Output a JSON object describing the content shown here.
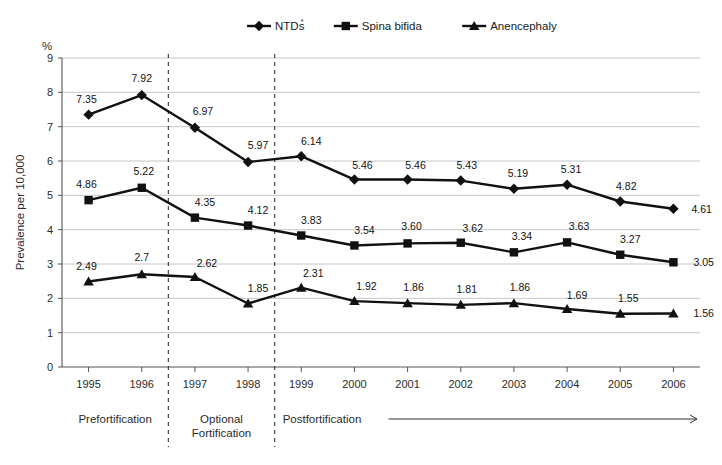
{
  "chart_data": {
    "type": "line",
    "title": "",
    "xlabel": "",
    "ylabel": "Prevalence per 10,000",
    "yunit": "%",
    "ylim": [
      0,
      9
    ],
    "ytick_labels": [
      "0",
      "1",
      "2",
      "3",
      "4",
      "5",
      "6",
      "7",
      "8",
      "9"
    ],
    "grid": true,
    "legend_position": "top",
    "categories": [
      "1995",
      "1996",
      "1997",
      "1998",
      "1999",
      "2000",
      "2001",
      "2002",
      "2003",
      "2004",
      "2005",
      "2006"
    ],
    "series": [
      {
        "name": "NTDs",
        "name_superscript": "*",
        "marker": "diamond",
        "values": [
          7.35,
          7.92,
          6.97,
          5.97,
          6.14,
          5.46,
          5.46,
          5.43,
          5.19,
          5.31,
          4.82,
          4.61
        ],
        "labels": [
          "7.35",
          "7.92",
          "6.97",
          "5.97",
          "6.14",
          "5.46",
          "5.46",
          "5.43",
          "5.19",
          "5.31",
          "4.82",
          "4.61"
        ]
      },
      {
        "name": "Spina bifida",
        "marker": "square",
        "values": [
          4.86,
          5.22,
          4.35,
          4.12,
          3.83,
          3.54,
          3.6,
          3.62,
          3.34,
          3.63,
          3.27,
          3.05
        ],
        "labels": [
          "4.86",
          "5.22",
          "4.35",
          "4.12",
          "3.83",
          "3.54",
          "3.60",
          "3.62",
          "3.34",
          "3.63",
          "3.27",
          "3.05"
        ]
      },
      {
        "name": "Anencephaly",
        "marker": "triangle",
        "values": [
          2.49,
          2.7,
          2.62,
          1.85,
          2.31,
          1.92,
          1.86,
          1.81,
          1.86,
          1.69,
          1.55,
          1.56
        ],
        "labels": [
          "2.49",
          "2.7",
          "2.62",
          "1.85",
          "2.31",
          "1.92",
          "1.86",
          "1.81",
          "1.86",
          "1.69",
          "1.55",
          "1.56"
        ]
      }
    ],
    "annotations": [
      {
        "text": "Prefortification",
        "span": [
          "1995",
          "1996"
        ]
      },
      {
        "text": "Optional",
        "text2": "Fortification",
        "span": [
          "1997",
          "1998"
        ]
      },
      {
        "text": "Postfortification",
        "span": [
          "1999",
          "2006"
        ],
        "arrow": true
      }
    ],
    "dividers": [
      2,
      4
    ],
    "line_color": "#111111",
    "grid_color": "#b8b8b8",
    "axis_color": "#555555"
  }
}
